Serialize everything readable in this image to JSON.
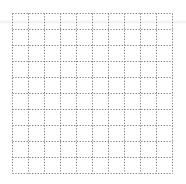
{
  "document": {
    "type": "blank-grid-worksheet",
    "grid": {
      "rows": 10,
      "columns": 10,
      "cell_size_px": 16,
      "line_style": "dotted",
      "line_color": "#7a7a7a",
      "background_color": "#ffffff"
    }
  }
}
